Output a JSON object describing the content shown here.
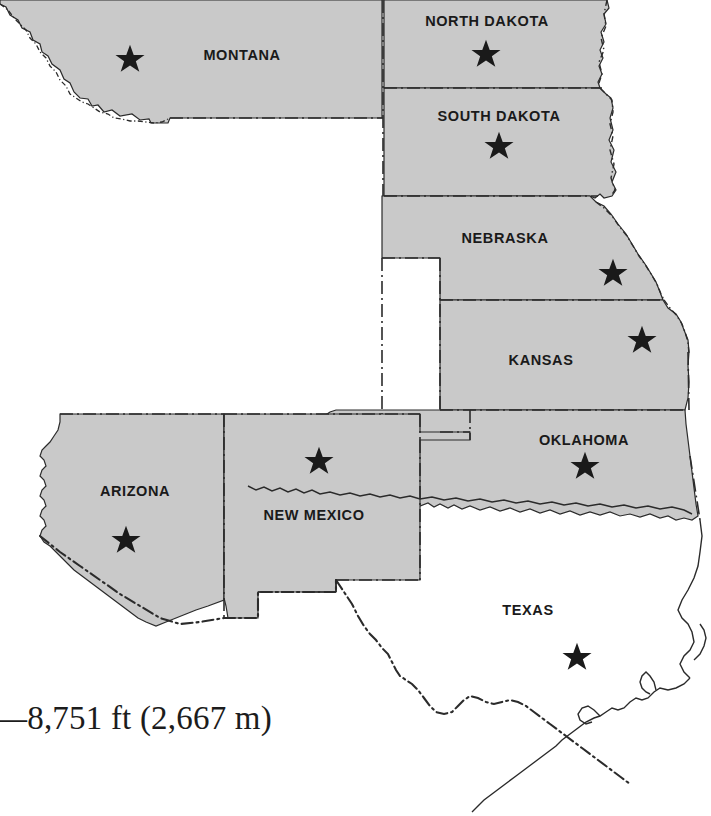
{
  "map": {
    "title": "Great Plains and Southwest states reference map",
    "colors": {
      "shaded_state_fill": "#c9c9c9",
      "unshaded_state_fill": "#ffffff",
      "border_line": "#2b2b2b",
      "label_text": "#1a1a1a",
      "star_marker": "#1a1a1a",
      "background": "#ffffff"
    },
    "legend_marker": "star-marker",
    "states": [
      {
        "id": "montana",
        "label": "MONTANA",
        "shaded": true,
        "label_x": 242,
        "label_y": 60,
        "star_x": 130,
        "star_y": 59
      },
      {
        "id": "north-dakota",
        "label": "NORTH DAKOTA",
        "shaded": true,
        "label_x": 487,
        "label_y": 26,
        "star_x": 486,
        "star_y": 54
      },
      {
        "id": "south-dakota",
        "label": "SOUTH DAKOTA",
        "shaded": true,
        "label_x": 499,
        "label_y": 121,
        "star_x": 499,
        "star_y": 146
      },
      {
        "id": "nebraska",
        "label": "NEBRASKA",
        "shaded": true,
        "label_x": 505,
        "label_y": 243,
        "star_x": 613,
        "star_y": 273
      },
      {
        "id": "kansas",
        "label": "KANSAS",
        "shaded": true,
        "label_x": 541,
        "label_y": 365,
        "star_x": 642,
        "star_y": 340
      },
      {
        "id": "oklahoma",
        "label": "OKLAHOMA",
        "shaded": true,
        "label_x": 584,
        "label_y": 445,
        "star_x": 585,
        "star_y": 466
      },
      {
        "id": "arizona",
        "label": "ARIZONA",
        "shaded": true,
        "label_x": 135,
        "label_y": 496,
        "star_x": 126,
        "star_y": 540
      },
      {
        "id": "new-mexico",
        "label": "NEW MEXICO",
        "shaded": true,
        "label_x": 314,
        "label_y": 520,
        "star_x": 319,
        "star_y": 461
      },
      {
        "id": "texas",
        "label": "TEXAS",
        "shaded": false,
        "label_x": 528,
        "label_y": 615,
        "star_x": 577,
        "star_y": 657
      }
    ]
  },
  "caption": {
    "text": "—8,751 ft (2,667 m)"
  }
}
